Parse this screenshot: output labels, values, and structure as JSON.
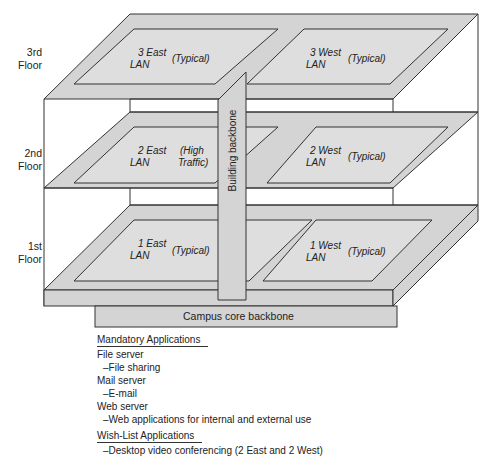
{
  "floors": [
    {
      "label_line1": "3rd",
      "label_line2": "Floor",
      "east": {
        "name_line1": "3 East",
        "name_line2": "LAN",
        "note_line1": "(Typical)",
        "note_line2": ""
      },
      "west": {
        "name_line1": "3 West",
        "name_line2": "LAN",
        "note_line1": "(Typical)",
        "note_line2": ""
      }
    },
    {
      "label_line1": "2nd",
      "label_line2": "Floor",
      "east": {
        "name_line1": "2 East",
        "name_line2": "LAN",
        "note_line1": "(High",
        "note_line2": "Traffic)"
      },
      "west": {
        "name_line1": "2 West",
        "name_line2": "LAN",
        "note_line1": "(Typical)",
        "note_line2": ""
      }
    },
    {
      "label_line1": "1st",
      "label_line2": "Floor",
      "east": {
        "name_line1": "1 East",
        "name_line2": "LAN",
        "note_line1": "(Typical)",
        "note_line2": ""
      },
      "west": {
        "name_line1": "1 West",
        "name_line2": "LAN",
        "note_line1": "(Typical)",
        "note_line2": ""
      }
    }
  ],
  "backbones": {
    "building": "Building backbone",
    "campus": "Campus core backbone"
  },
  "colors": {
    "slab_fill": "#d4d4d4",
    "lan_fill": "#dedede",
    "line": "#333333",
    "background": "#ffffff"
  },
  "applications": {
    "mandatory_heading": "Mandatory Applications",
    "mandatory": [
      {
        "server": "File server",
        "use": "–File sharing"
      },
      {
        "server": "Mail server",
        "use": "–E-mail"
      },
      {
        "server": "Web server",
        "use": "–Web applications for internal and external use"
      }
    ],
    "wishlist_heading": "Wish-List Applications",
    "wishlist": [
      "–Desktop video conferencing (2 East and 2 West)"
    ]
  }
}
